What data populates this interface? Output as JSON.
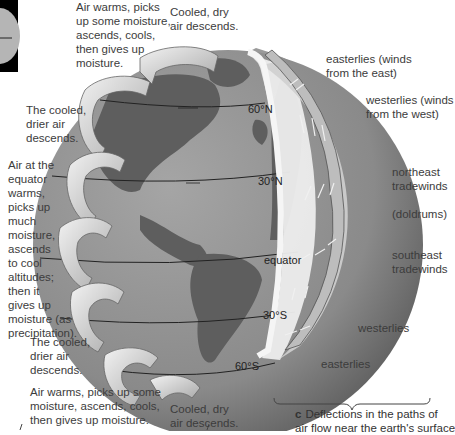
{
  "figure": {
    "panel_letter": "c",
    "caption": "Deflections in the paths of air flow near the earth's surface",
    "caption_line1": "Deflections in the paths of",
    "caption_line2": "air flow near the earth's surface"
  },
  "left_labels": {
    "top_rise": [
      "Air warms, picks",
      "up some moisture,",
      "ascends, cools,",
      "then gives up",
      "moisture."
    ],
    "top_descend": [
      "Cooled, dry",
      "air descends."
    ],
    "north_descend": [
      "The cooled,",
      "drier air",
      "descends."
    ],
    "equator_rise": [
      "Air at the",
      "equator",
      "warms,",
      "picks up",
      "much",
      "moisture,",
      "ascends",
      "to cool",
      "altitudes;",
      "then it",
      "gives up",
      "moisture (as",
      "precipitation)."
    ],
    "south_descend": [
      "The cooled,",
      "drier air",
      "descends."
    ],
    "bottom_rise": [
      "Air warms, picks up some",
      "moisture, ascends, cools,",
      "then gives up moisture."
    ],
    "bottom_descend": [
      "Cooled, dry",
      "air descends."
    ]
  },
  "latitudes": [
    "60°N",
    "30°N",
    "equator",
    "30°S",
    "60°S"
  ],
  "wind_labels": [
    [
      "easterlies (winds",
      "from the east)"
    ],
    [
      "westerlies (winds",
      "from the west)"
    ],
    [
      "northeast",
      "tradewinds"
    ],
    [
      "(doldrums)"
    ],
    [
      "southeast",
      "tradewinds"
    ],
    [
      "westerlies"
    ],
    [
      "easterlies"
    ]
  ],
  "colors": {
    "ocean": "#8e8e8e",
    "land": "#5f5f5f",
    "shell": "#c9c9c9",
    "arrow": "#d8d8d8",
    "inset_bg": "#000000"
  }
}
